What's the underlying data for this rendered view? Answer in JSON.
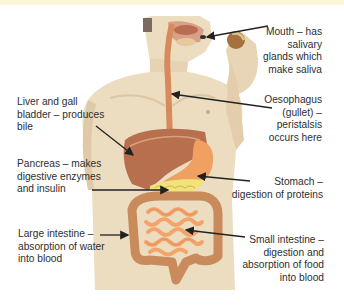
{
  "diagram": {
    "labels": {
      "mouth": [
        "Mouth – has",
        "salivary",
        "glands which",
        "make saliva"
      ],
      "oesophagus": [
        "Oesophagus",
        "(gullet) –",
        "peristalsis",
        "occurs here"
      ],
      "liver": [
        "Liver and gall",
        "bladder – produces",
        "bile"
      ],
      "pancreas": [
        "Pancreas – makes",
        "digestive enzymes",
        "and insulin"
      ],
      "stomach": [
        "Stomach –",
        "digestion of proteins"
      ],
      "large_intestine": [
        "Large intestine –",
        "absorption of water",
        "into blood"
      ],
      "small_intestine": [
        "Small intestine –",
        "digestion and",
        "absorption of food",
        "into blood"
      ]
    },
    "colors": {
      "skin": "#ecdcc0",
      "skin_shadow": "#dcc6a4",
      "liver": "#b86f4e",
      "stomach": "#f0a060",
      "pancreas": "#f2e27a",
      "small_intestine": "#f3a46a",
      "large_intestine": "#c98a5c",
      "oesophagus": "#d98a5c",
      "arrow": "#222222",
      "text": "#2e2e2e"
    }
  }
}
